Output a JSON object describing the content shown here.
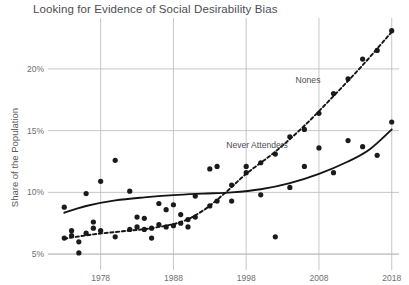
{
  "chart_data": {
    "type": "scatter",
    "title": "Looking for Evidence of Social Desirability Bias",
    "xlabel": "",
    "ylabel": "Share of the Population",
    "xlim": [
      1972,
      2019
    ],
    "ylim": [
      4.2,
      23.8
    ],
    "grid": true,
    "legend_position": "inline-annotation",
    "x_ticks": [
      1978,
      1988,
      1998,
      2008,
      2018
    ],
    "x_tick_labels": [
      "1978",
      "1988",
      "1998",
      "2008",
      "2018"
    ],
    "y_ticks": [
      5,
      10,
      15,
      20
    ],
    "y_tick_labels": [
      "5%",
      "10%",
      "15%",
      "20%"
    ],
    "annotations": [
      {
        "text": "Nones",
        "x": 2006.5,
        "y": 18.9
      },
      {
        "text": "Never Attenders",
        "x": 1999.5,
        "y": 13.6
      }
    ],
    "series": [
      {
        "name": "Never Attenders",
        "marker": "circle",
        "color": "#1b1b1d",
        "fit_line": "solid",
        "points": [
          {
            "x": 1973,
            "y": 8.8
          },
          {
            "x": 1974,
            "y": 6.9
          },
          {
            "x": 1975,
            "y": 5.1
          },
          {
            "x": 1976,
            "y": 9.9
          },
          {
            "x": 1977,
            "y": 7.6
          },
          {
            "x": 1978,
            "y": 10.9
          },
          {
            "x": 1980,
            "y": 12.6
          },
          {
            "x": 1982,
            "y": 10.1
          },
          {
            "x": 1983,
            "y": 8.0
          },
          {
            "x": 1984,
            "y": 7.9
          },
          {
            "x": 1985,
            "y": 6.3
          },
          {
            "x": 1986,
            "y": 9.1
          },
          {
            "x": 1987,
            "y": 8.6
          },
          {
            "x": 1988,
            "y": 9.0
          },
          {
            "x": 1989,
            "y": 8.2
          },
          {
            "x": 1990,
            "y": 7.2
          },
          {
            "x": 1991,
            "y": 9.7
          },
          {
            "x": 1993,
            "y": 11.9
          },
          {
            "x": 1994,
            "y": 12.1
          },
          {
            "x": 1996,
            "y": 9.3
          },
          {
            "x": 1998,
            "y": 11.6
          },
          {
            "x": 2000,
            "y": 9.8
          },
          {
            "x": 2002,
            "y": 6.4
          },
          {
            "x": 2004,
            "y": 10.4
          },
          {
            "x": 2006,
            "y": 12.1
          },
          {
            "x": 2008,
            "y": 13.6
          },
          {
            "x": 2010,
            "y": 11.6
          },
          {
            "x": 2012,
            "y": 14.2
          },
          {
            "x": 2014,
            "y": 13.7
          },
          {
            "x": 2016,
            "y": 13.0
          },
          {
            "x": 2018,
            "y": 15.7
          }
        ],
        "fit_points": [
          {
            "x": 1973,
            "y": 8.35
          },
          {
            "x": 1976,
            "y": 8.9
          },
          {
            "x": 1980,
            "y": 9.35
          },
          {
            "x": 1984,
            "y": 9.6
          },
          {
            "x": 1988,
            "y": 9.78
          },
          {
            "x": 1992,
            "y": 9.9
          },
          {
            "x": 1996,
            "y": 10.0
          },
          {
            "x": 2000,
            "y": 10.25
          },
          {
            "x": 2004,
            "y": 10.75
          },
          {
            "x": 2008,
            "y": 11.5
          },
          {
            "x": 2012,
            "y": 12.5
          },
          {
            "x": 2015,
            "y": 13.5
          },
          {
            "x": 2018,
            "y": 15.1
          }
        ]
      },
      {
        "name": "Nones",
        "marker": "circle",
        "color": "#1b1b1d",
        "fit_line": "dashed",
        "points": [
          {
            "x": 1973,
            "y": 6.3
          },
          {
            "x": 1974,
            "y": 6.5
          },
          {
            "x": 1975,
            "y": 6.0
          },
          {
            "x": 1976,
            "y": 6.7
          },
          {
            "x": 1977,
            "y": 7.1
          },
          {
            "x": 1978,
            "y": 6.9
          },
          {
            "x": 1980,
            "y": 6.4
          },
          {
            "x": 1982,
            "y": 7.0
          },
          {
            "x": 1983,
            "y": 7.2
          },
          {
            "x": 1984,
            "y": 7.0
          },
          {
            "x": 1985,
            "y": 7.1
          },
          {
            "x": 1986,
            "y": 7.4
          },
          {
            "x": 1987,
            "y": 7.2
          },
          {
            "x": 1988,
            "y": 7.3
          },
          {
            "x": 1989,
            "y": 7.5
          },
          {
            "x": 1990,
            "y": 7.8
          },
          {
            "x": 1991,
            "y": 8.0
          },
          {
            "x": 1993,
            "y": 8.9
          },
          {
            "x": 1994,
            "y": 9.3
          },
          {
            "x": 1996,
            "y": 10.6
          },
          {
            "x": 1998,
            "y": 12.1
          },
          {
            "x": 2000,
            "y": 12.4
          },
          {
            "x": 2002,
            "y": 13.1
          },
          {
            "x": 2004,
            "y": 14.5
          },
          {
            "x": 2006,
            "y": 15.1
          },
          {
            "x": 2008,
            "y": 16.4
          },
          {
            "x": 2010,
            "y": 18.0
          },
          {
            "x": 2012,
            "y": 19.2
          },
          {
            "x": 2014,
            "y": 20.8
          },
          {
            "x": 2016,
            "y": 21.5
          },
          {
            "x": 2018,
            "y": 23.1
          }
        ],
        "fit_points": [
          {
            "x": 1973,
            "y": 6.25
          },
          {
            "x": 1977,
            "y": 6.6
          },
          {
            "x": 1981,
            "y": 6.85
          },
          {
            "x": 1985,
            "y": 7.1
          },
          {
            "x": 1989,
            "y": 7.6
          },
          {
            "x": 1992,
            "y": 8.5
          },
          {
            "x": 1995,
            "y": 9.9
          },
          {
            "x": 1998,
            "y": 11.5
          },
          {
            "x": 2002,
            "y": 13.3
          },
          {
            "x": 2006,
            "y": 15.4
          },
          {
            "x": 2010,
            "y": 17.8
          },
          {
            "x": 2014,
            "y": 20.3
          },
          {
            "x": 2018,
            "y": 23.0
          }
        ]
      }
    ]
  }
}
